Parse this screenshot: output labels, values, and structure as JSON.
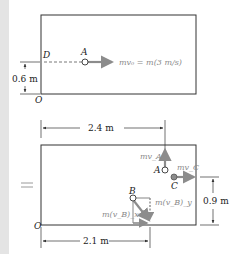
{
  "figure": {
    "top_panel": {
      "point_D": "D",
      "point_A": "A",
      "point_O": "O",
      "momentum_label": "mv₀ = m(3 m/s)",
      "height_dim": "0.6 m"
    },
    "equals_sign": "=",
    "bottom_panel": {
      "width_dim_top": "2.4 m",
      "point_A": "A",
      "momentum_A": "mv_A",
      "point_C": "C",
      "momentum_C": "mv_C",
      "point_B": "B",
      "momentum_B_y": "m(v_B)_y",
      "momentum_B_x": "m(v_B)_x",
      "point_O": "O",
      "height_dim": "0.9 m",
      "width_dim_bottom": "2.1 m"
    },
    "colors": {
      "line": "#333333",
      "vector": "#8c8c8c",
      "background": "#ffffff",
      "margin_strip": "#e4e4e4"
    }
  }
}
